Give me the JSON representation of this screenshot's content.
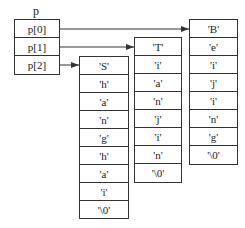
{
  "diagram": {
    "pointer_array": {
      "name": "p",
      "elements": [
        "p[0]",
        "p[1]",
        "p[2]"
      ]
    },
    "strings": [
      {
        "pointer": "p[2]",
        "chars": [
          "'S'",
          "'h'",
          "'a'",
          "'n'",
          "'g'",
          "'h'",
          "'a'",
          "'i'",
          "'\\0'"
        ]
      },
      {
        "pointer": "p[1]",
        "chars": [
          "'T'",
          "'i'",
          "'a'",
          "'n'",
          "'j'",
          "'i'",
          "'n'",
          "'\\0'"
        ]
      },
      {
        "pointer": "p[0]",
        "chars": [
          "'B'",
          "'e'",
          "'i'",
          "'j'",
          "'i'",
          "'n'",
          "'g'",
          "'\\0'"
        ]
      }
    ],
    "colors": {
      "line": "#333333",
      "background": "#ffffff"
    }
  }
}
